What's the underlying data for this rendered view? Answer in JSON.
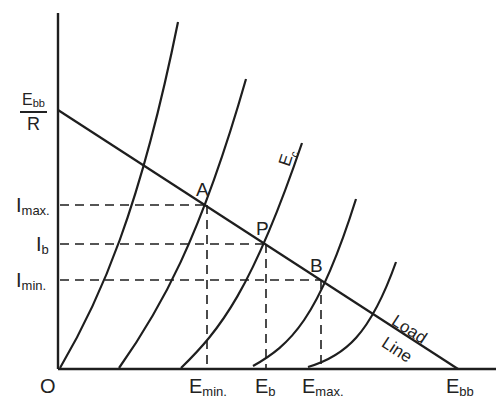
{
  "diagram": {
    "colors": {
      "line": "#1e1e1e",
      "background": "#ffffff"
    },
    "axes": {
      "origin_label": "O",
      "y_intercept": {
        "numerator": "E",
        "numerator_sub": "bb",
        "denominator": "R"
      },
      "y_labels": [
        {
          "main": "I",
          "sub": "max."
        },
        {
          "main": "I",
          "sub": "b"
        },
        {
          "main": "I",
          "sub": "min."
        }
      ],
      "x_labels": [
        {
          "main": "E",
          "sub": "min."
        },
        {
          "main": "E",
          "sub": "b"
        },
        {
          "main": "E",
          "sub": "max."
        },
        {
          "main": "E",
          "sub": "bb"
        }
      ]
    },
    "points": {
      "a": "A",
      "p": "P",
      "b": "B"
    },
    "curve_label": {
      "main": "E",
      "sub": "c"
    },
    "load_line_label": {
      "line1": "Load",
      "line2": "Line"
    },
    "curve_count": 5
  }
}
